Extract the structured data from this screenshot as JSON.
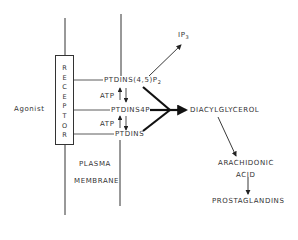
{
  "diagram": {
    "agonist": "Agonist",
    "receptor_letters": [
      "R",
      "E",
      "C",
      "E",
      "P",
      "T",
      "O",
      "R"
    ],
    "membrane_label_1": "PLASMA",
    "membrane_label_2": "MEMBRANE",
    "pip2": "PTDINS(4,5)P",
    "pip2_sub": "2",
    "pip": "PTDINS4P",
    "pi": "PTDINS",
    "atp_top": "ATP",
    "atp_bottom": "ATP",
    "ip3": "IP",
    "ip3_sub": "3",
    "dag": "DIACYLGLYCEROL",
    "arachidonic_1": "ARACHIDONIC",
    "arachidonic_2": "ACID",
    "prostaglandins": "PROSTAGLANDINS"
  }
}
